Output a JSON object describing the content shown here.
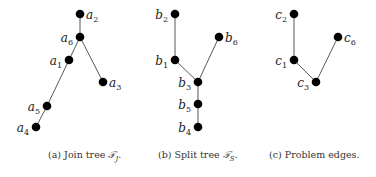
{
  "figure": {
    "panels": [
      {
        "id": "a",
        "caption_prefix": "(a) Join tree ",
        "caption_symbol": "𝒯",
        "caption_sub": "J",
        "caption_suffix": ".",
        "nodes": [
          {
            "name": "a",
            "sub": "2",
            "x": 80,
            "y": 14,
            "label_side": "right"
          },
          {
            "name": "a",
            "sub": "6",
            "x": 80,
            "y": 37,
            "label_side": "left"
          },
          {
            "name": "a",
            "sub": "1",
            "x": 69,
            "y": 60,
            "label_side": "left"
          },
          {
            "name": "a",
            "sub": "3",
            "x": 103,
            "y": 82,
            "label_side": "right"
          },
          {
            "name": "a",
            "sub": "5",
            "x": 47,
            "y": 106,
            "label_side": "left"
          },
          {
            "name": "a",
            "sub": "4",
            "x": 36,
            "y": 127,
            "label_side": "left"
          }
        ],
        "edges": [
          [
            0,
            1
          ],
          [
            1,
            2
          ],
          [
            1,
            3
          ],
          [
            2,
            4
          ],
          [
            4,
            5
          ]
        ]
      },
      {
        "id": "b",
        "caption_prefix": "(b) Split tree ",
        "caption_symbol": "𝒯",
        "caption_sub": "S",
        "caption_suffix": ".",
        "nodes": [
          {
            "name": "b",
            "sub": "2",
            "x": 175,
            "y": 14,
            "label_side": "left"
          },
          {
            "name": "b",
            "sub": "6",
            "x": 219,
            "y": 37,
            "label_side": "right"
          },
          {
            "name": "b",
            "sub": "1",
            "x": 175,
            "y": 60,
            "label_side": "left"
          },
          {
            "name": "b",
            "sub": "3",
            "x": 198,
            "y": 82,
            "label_side": "left"
          },
          {
            "name": "b",
            "sub": "5",
            "x": 198,
            "y": 104,
            "label_side": "left"
          },
          {
            "name": "b",
            "sub": "4",
            "x": 198,
            "y": 127,
            "label_side": "left"
          }
        ],
        "edges": [
          [
            0,
            2
          ],
          [
            2,
            3
          ],
          [
            1,
            3
          ],
          [
            3,
            4
          ],
          [
            4,
            5
          ]
        ]
      },
      {
        "id": "c",
        "caption_prefix": "(c) Problem edges.",
        "caption_symbol": "",
        "caption_sub": "",
        "caption_suffix": "",
        "nodes": [
          {
            "name": "c",
            "sub": "2",
            "x": 294,
            "y": 14,
            "label_side": "left"
          },
          {
            "name": "c",
            "sub": "6",
            "x": 338,
            "y": 37,
            "label_side": "right"
          },
          {
            "name": "c",
            "sub": "1",
            "x": 294,
            "y": 60,
            "label_side": "left"
          },
          {
            "name": "c",
            "sub": "3",
            "x": 316,
            "y": 82,
            "label_side": "left"
          }
        ],
        "edges": [
          [
            0,
            2
          ],
          [
            2,
            3
          ],
          [
            1,
            3
          ]
        ]
      }
    ]
  },
  "captions": {
    "a": {
      "prefix": "(a) Join tree ",
      "symbol": "𝒯",
      "sub": "J",
      "suffix": "."
    },
    "b": {
      "prefix": "(b) Split tree ",
      "symbol": "𝒯",
      "sub": "S",
      "suffix": "."
    },
    "c": {
      "text": "(c) Problem edges."
    }
  }
}
